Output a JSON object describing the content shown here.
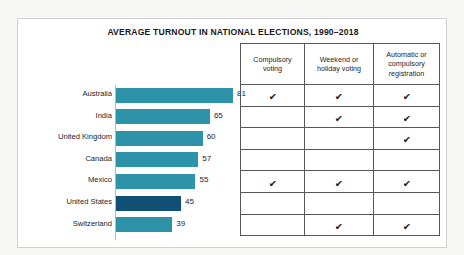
{
  "card": {
    "title": "AVERAGE TURNOUT IN NATIONAL ELECTIONS, 1990–2018"
  },
  "colors": {
    "bar": "#2d93a8",
    "bar_highlight": "#0f5074",
    "page_background": "#f7f7f5",
    "card_background": "#ffffff",
    "table_border": "#55565a",
    "text": "#1d1d1f"
  },
  "chart_data": {
    "type": "bar",
    "title": "AVERAGE TURNOUT IN NATIONAL ELECTIONS, 1990–2018",
    "xlabel": "",
    "ylabel": "",
    "orientation": "horizontal",
    "xlim": [
      0,
      90
    ],
    "grid": false,
    "legend": "none",
    "categories": [
      "Australia",
      "India",
      "United Kingdom",
      "Canada",
      "Mexico",
      "United States",
      "Switzerland"
    ],
    "values": [
      81,
      65,
      60,
      57,
      55,
      45,
      39
    ],
    "highlighted_category": "United States",
    "annotations": [
      "Value labels shown to the right of each bar",
      "United States bar rendered in dark blue to highlight it"
    ]
  },
  "matrix": {
    "headers": [
      "Compulsory voting",
      "Weekend or holiday voting",
      "Automatic or compulsory registration"
    ],
    "check_glyph": "✔",
    "rows": [
      {
        "country": "Australia",
        "cells": [
          true,
          true,
          true
        ]
      },
      {
        "country": "India",
        "cells": [
          false,
          true,
          true
        ]
      },
      {
        "country": "United Kingdom",
        "cells": [
          false,
          false,
          true
        ]
      },
      {
        "country": "Canada",
        "cells": [
          false,
          false,
          false
        ]
      },
      {
        "country": "Mexico",
        "cells": [
          true,
          true,
          true
        ]
      },
      {
        "country": "United States",
        "cells": [
          false,
          false,
          false
        ]
      },
      {
        "country": "Switzerland",
        "cells": [
          false,
          true,
          true
        ]
      }
    ]
  }
}
